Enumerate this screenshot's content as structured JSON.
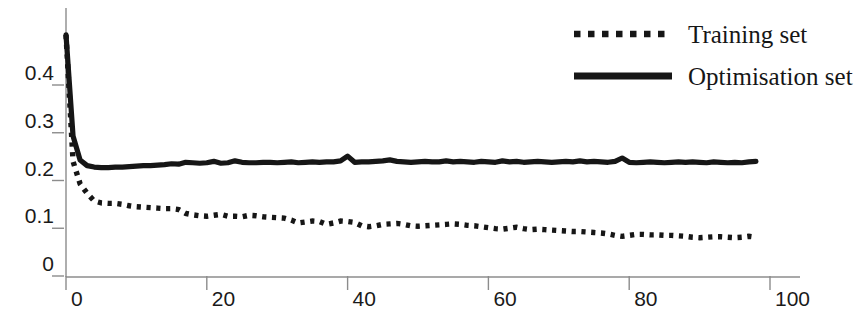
{
  "chart_data": {
    "type": "line",
    "title": "",
    "subtitle": "",
    "xlabel": "",
    "ylabel": "",
    "xlim": [
      0,
      100
    ],
    "ylim": [
      0,
      0.48
    ],
    "xticks": [
      0,
      20,
      40,
      60,
      80,
      100
    ],
    "xtick_labels": [
      "0",
      "20",
      "40",
      "60",
      "80",
      "100"
    ],
    "yticks": [
      0,
      0.1,
      0.2,
      0.3,
      0.4
    ],
    "ytick_labels": [
      "0",
      "0.1",
      "0.2",
      "0.3",
      "0.4"
    ],
    "yminor_ticks": [
      0.05,
      0.15,
      0.25,
      0.35,
      0.45
    ],
    "grid": false,
    "legend_position": "top-right",
    "axis_color": "#8c8c8c",
    "series_color": "#161616",
    "background": "#ffffff",
    "series": [
      {
        "name": "Training set",
        "style": "dotted",
        "color": "#161616",
        "x": [
          0,
          1,
          2,
          3,
          4,
          5,
          6,
          7,
          8,
          9,
          10,
          11,
          12,
          13,
          14,
          15,
          16,
          17,
          18,
          19,
          20,
          21,
          22,
          23,
          24,
          25,
          26,
          27,
          28,
          29,
          30,
          31,
          32,
          33,
          34,
          35,
          36,
          37,
          38,
          39,
          40,
          41,
          42,
          43,
          44,
          45,
          46,
          47,
          48,
          49,
          50,
          51,
          52,
          53,
          54,
          55,
          56,
          57,
          58,
          59,
          60,
          61,
          62,
          63,
          64,
          65,
          66,
          67,
          68,
          69,
          70,
          71,
          72,
          73,
          74,
          75,
          76,
          77,
          78,
          79,
          80,
          81,
          82,
          83,
          84,
          85,
          86,
          87,
          88,
          89,
          90,
          91,
          92,
          93,
          94,
          95,
          96,
          97,
          98
        ],
        "y": [
          0.48,
          0.215,
          0.168,
          0.148,
          0.132,
          0.128,
          0.127,
          0.127,
          0.125,
          0.122,
          0.12,
          0.119,
          0.118,
          0.117,
          0.116,
          0.116,
          0.114,
          0.106,
          0.103,
          0.101,
          0.1,
          0.102,
          0.104,
          0.1,
          0.1,
          0.099,
          0.102,
          0.101,
          0.099,
          0.098,
          0.097,
          0.096,
          0.092,
          0.086,
          0.088,
          0.09,
          0.089,
          0.083,
          0.086,
          0.09,
          0.089,
          0.087,
          0.08,
          0.078,
          0.08,
          0.083,
          0.084,
          0.085,
          0.083,
          0.08,
          0.079,
          0.08,
          0.081,
          0.082,
          0.083,
          0.084,
          0.083,
          0.081,
          0.08,
          0.078,
          0.076,
          0.074,
          0.073,
          0.075,
          0.077,
          0.074,
          0.072,
          0.073,
          0.072,
          0.071,
          0.07,
          0.069,
          0.068,
          0.068,
          0.067,
          0.066,
          0.065,
          0.063,
          0.06,
          0.058,
          0.06,
          0.062,
          0.062,
          0.061,
          0.061,
          0.06,
          0.06,
          0.059,
          0.058,
          0.056,
          0.055,
          0.056,
          0.057,
          0.057,
          0.056,
          0.055,
          0.056,
          0.058,
          0.056
        ]
      },
      {
        "name": "Optimisation set",
        "style": "solid",
        "color": "#161616",
        "x": [
          0,
          1,
          2,
          3,
          4,
          5,
          6,
          7,
          8,
          9,
          10,
          11,
          12,
          13,
          14,
          15,
          16,
          17,
          18,
          19,
          20,
          21,
          22,
          23,
          24,
          25,
          26,
          27,
          28,
          29,
          30,
          31,
          32,
          33,
          34,
          35,
          36,
          37,
          38,
          39,
          40,
          41,
          42,
          43,
          44,
          45,
          46,
          47,
          48,
          49,
          50,
          51,
          52,
          53,
          54,
          55,
          56,
          57,
          58,
          59,
          60,
          61,
          62,
          63,
          64,
          65,
          66,
          67,
          68,
          69,
          70,
          71,
          72,
          73,
          74,
          75,
          76,
          77,
          78,
          79,
          80,
          81,
          82,
          83,
          84,
          85,
          86,
          87,
          88,
          89,
          90,
          91,
          92,
          93,
          94,
          95,
          96,
          97,
          98
        ],
        "y": [
          0.48,
          0.268,
          0.218,
          0.206,
          0.203,
          0.202,
          0.202,
          0.203,
          0.203,
          0.204,
          0.205,
          0.206,
          0.206,
          0.207,
          0.208,
          0.21,
          0.209,
          0.213,
          0.212,
          0.211,
          0.212,
          0.215,
          0.211,
          0.212,
          0.216,
          0.213,
          0.212,
          0.212,
          0.213,
          0.213,
          0.212,
          0.213,
          0.214,
          0.212,
          0.213,
          0.214,
          0.213,
          0.214,
          0.214,
          0.216,
          0.226,
          0.213,
          0.214,
          0.214,
          0.215,
          0.216,
          0.218,
          0.215,
          0.214,
          0.213,
          0.214,
          0.215,
          0.214,
          0.214,
          0.216,
          0.214,
          0.215,
          0.214,
          0.213,
          0.215,
          0.214,
          0.213,
          0.216,
          0.214,
          0.215,
          0.213,
          0.214,
          0.215,
          0.214,
          0.213,
          0.214,
          0.215,
          0.214,
          0.216,
          0.214,
          0.215,
          0.214,
          0.213,
          0.215,
          0.222,
          0.213,
          0.212,
          0.213,
          0.214,
          0.213,
          0.212,
          0.213,
          0.214,
          0.213,
          0.214,
          0.213,
          0.212,
          0.214,
          0.213,
          0.212,
          0.213,
          0.212,
          0.214,
          0.215
        ]
      }
    ]
  },
  "legend": {
    "entries": [
      {
        "label": "Training set",
        "style": "dotted"
      },
      {
        "label": "Optimisation set",
        "style": "solid"
      }
    ]
  }
}
